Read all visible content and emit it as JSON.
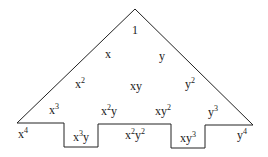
{
  "diagram": {
    "type": "monomial-staircase-triangle",
    "outline_color": "#222222",
    "rows": [
      [
        {
          "base": "1",
          "exp": ""
        }
      ],
      [
        {
          "base": "x",
          "exp": ""
        },
        {
          "base": "y",
          "exp": ""
        }
      ],
      [
        {
          "base": "x",
          "exp": "2"
        },
        {
          "base": "xy",
          "exp": ""
        },
        {
          "base": "y",
          "exp": "2"
        }
      ],
      [
        {
          "base": "x",
          "exp": "3"
        },
        {
          "base": "x",
          "exp": "2",
          "tail": "y"
        },
        {
          "base": "xy",
          "exp": "2"
        },
        {
          "base": "y",
          "exp": "3"
        }
      ],
      [
        {
          "base": "x",
          "exp": "4"
        },
        {
          "base": "x",
          "exp": "3",
          "tail": "y"
        },
        {
          "base": "x",
          "exp": "2",
          "tail": "y",
          "tail_exp": "2"
        },
        {
          "base": "xy",
          "exp": "3"
        },
        {
          "base": "y",
          "exp": "4"
        }
      ]
    ]
  }
}
